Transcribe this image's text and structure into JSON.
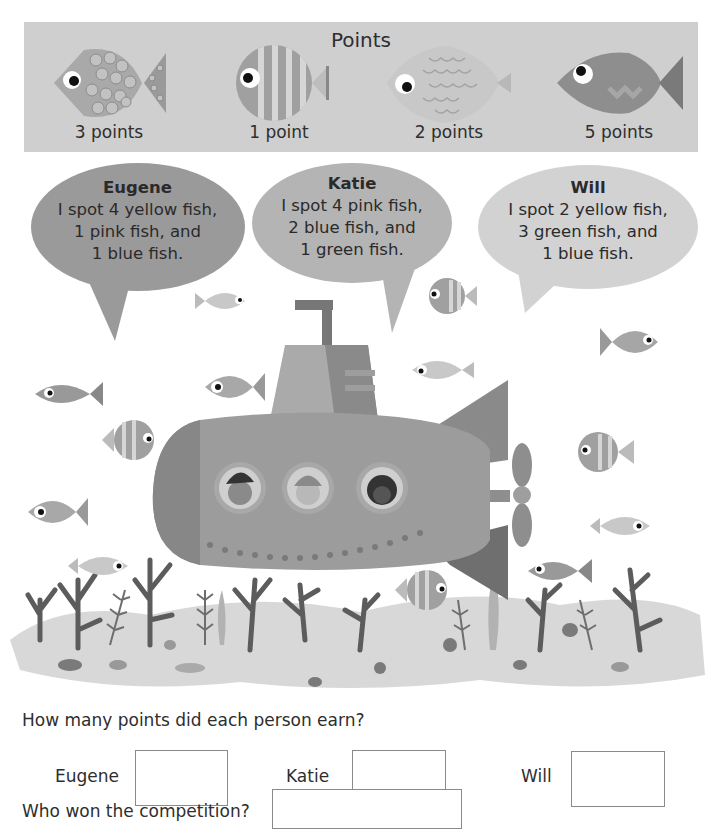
{
  "points_panel": {
    "title": "Points",
    "fish": [
      {
        "pattern": "spotted-fish",
        "label": "3 points",
        "color": "yellow"
      },
      {
        "pattern": "striped-fish",
        "label": "1 point",
        "color": "pink"
      },
      {
        "pattern": "scaled-fish",
        "label": "2 points",
        "color": "blue"
      },
      {
        "pattern": "plain-fish",
        "label": "5 points",
        "color": "green"
      }
    ]
  },
  "speech_bubbles": [
    {
      "name": "Eugene",
      "lines": [
        "I spot 4 yellow fish,",
        "1 pink fish, and",
        "1 blue fish."
      ]
    },
    {
      "name": "Katie",
      "lines": [
        "I spot 4 pink fish,",
        "2 blue fish, and",
        "1 green fish."
      ]
    },
    {
      "name": "Will",
      "lines": [
        "I spot 2 yellow fish,",
        "3 green fish, and",
        "1 blue fish."
      ]
    }
  ],
  "questions": {
    "q1": "How many points did each person earn?",
    "answers": [
      {
        "label": "Eugene",
        "value": ""
      },
      {
        "label": "Katie",
        "value": ""
      },
      {
        "label": "Will",
        "value": ""
      }
    ],
    "q2": "Who won the competition?",
    "winner_value": ""
  },
  "colors": {
    "panel_bg": "#cfcfcf",
    "bubble_eugene": "#9a9a9a",
    "bubble_katie": "#b4b4b4",
    "bubble_will": "#d2d2d2",
    "submarine": "#9c9c9c"
  }
}
